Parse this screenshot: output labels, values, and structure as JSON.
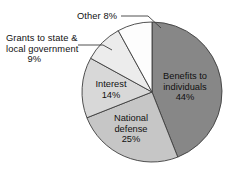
{
  "chart_data": {
    "type": "pie",
    "title": "",
    "subtitle": "",
    "xlabel": "",
    "ylabel": "",
    "legend_position": "none",
    "grid": false,
    "start_angle_deg": 0,
    "direction": "clockwise",
    "categories": [
      "Benefits to individuals",
      "National defense",
      "Interest",
      "Grants to state & local government",
      "Other"
    ],
    "values": [
      44,
      25,
      14,
      9,
      8
    ],
    "value_unit": "percent",
    "slices": [
      {
        "name": "Benefits to individuals",
        "label_line1": "Benefits to",
        "label_line2": "individuals",
        "value": 44,
        "value_label": "44%",
        "color": "#878787",
        "label_placement": "inside"
      },
      {
        "name": "National defense",
        "label_line1": "National",
        "label_line2": "defense",
        "value": 25,
        "value_label": "25%",
        "color": "#c6c6c6",
        "label_placement": "inside"
      },
      {
        "name": "Interest",
        "label_line1": "Interest",
        "label_line2": "",
        "value": 14,
        "value_label": "14%",
        "color": "#d8d8d8",
        "label_placement": "inside"
      },
      {
        "name": "Grants to state & local government",
        "label_line1": "Grants to state &",
        "label_line2": "local government",
        "value": 9,
        "value_label": "9%",
        "color": "#ececec",
        "label_placement": "outside-left"
      },
      {
        "name": "Other",
        "label_line1": "Other",
        "label_line2": "",
        "value": 8,
        "value_label": "8%",
        "color": "#fdfdfd",
        "label_placement": "outside-top"
      }
    ]
  },
  "labels": {
    "other": "Other 8%",
    "grants_line1": "Grants to state &",
    "grants_line2": "local government",
    "grants_pct": "9%",
    "interest_name": "Interest",
    "interest_pct": "14%",
    "defense_line1": "National",
    "defense_line2": "defense",
    "defense_pct": "25%",
    "benefits_line1": "Benefits to",
    "benefits_line2": "individuals",
    "benefits_pct": "44%"
  },
  "style": {
    "slice_outline": "#3d3d3d",
    "leader_line": "#3d3d3d",
    "background": "#ffffff"
  }
}
